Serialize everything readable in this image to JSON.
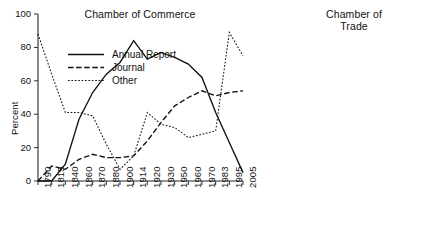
{
  "figure": {
    "width": 448,
    "height": 240,
    "background": "#ffffff",
    "line_color": "#111111"
  },
  "legend": {
    "position": "inside-left-panel-upper-left",
    "entries": [
      {
        "label": "Annual Report",
        "style": "solid",
        "key": "annual_report"
      },
      {
        "label": "Journal",
        "style": "dashed",
        "key": "journal"
      },
      {
        "label": "Other",
        "style": "dotted",
        "key": "other"
      }
    ]
  },
  "chart_data": [
    {
      "type": "line",
      "title": "Chamber of Commerce",
      "xlabel": "",
      "ylabel": "Percent",
      "ylim": [
        0,
        100
      ],
      "yticks": [
        0,
        20,
        40,
        60,
        80,
        100
      ],
      "grid": false,
      "categories": [
        "1790",
        "1815",
        "1840",
        "1860",
        "1870",
        "1880",
        "1900",
        "1914",
        "1920",
        "1930",
        "1950",
        "1960",
        "1970",
        "1983",
        "1995",
        "2005"
      ],
      "series": [
        {
          "name": "Annual Report",
          "style": "solid",
          "values": [
            0,
            0,
            10,
            37,
            53,
            64,
            71,
            84,
            73,
            77,
            74,
            70,
            62,
            41,
            23,
            5
          ]
        },
        {
          "name": "Journal",
          "style": "dashed",
          "values": [
            0,
            9,
            7,
            13,
            16,
            14,
            14,
            15,
            24,
            35,
            45,
            50,
            54,
            51,
            53,
            54
          ]
        },
        {
          "name": "Other",
          "style": "dotted",
          "values": [
            88,
            64,
            41,
            41,
            39,
            22,
            7,
            15,
            41,
            34,
            32,
            26,
            28,
            30,
            89,
            75
          ]
        }
      ]
    },
    {
      "type": "line",
      "title": "Chamber of\nTrade",
      "xlabel": "",
      "ylabel": "Percent",
      "ylim": [
        0,
        100
      ],
      "yticks": [
        0,
        20,
        40,
        60,
        80,
        100
      ],
      "grid": false,
      "categories": [
        "1900",
        "1914",
        "1920",
        "1930",
        "1950",
        "1960",
        "1970",
        "1983",
        "1995",
        "2005"
      ],
      "series": [
        {
          "name": "Annual Report",
          "style": "solid",
          "values": [
            32,
            22,
            54,
            56,
            48,
            41,
            14,
            10,
            0,
            42
          ]
        },
        {
          "name": "Journal",
          "style": "dashed",
          "values": [
            0,
            0,
            13,
            17,
            18,
            20,
            15,
            52,
            13,
            22
          ]
        },
        {
          "name": "Other",
          "style": "dotted",
          "values": [
            0,
            6,
            14,
            20,
            22,
            38,
            41,
            40,
            62,
            34
          ]
        }
      ]
    }
  ]
}
